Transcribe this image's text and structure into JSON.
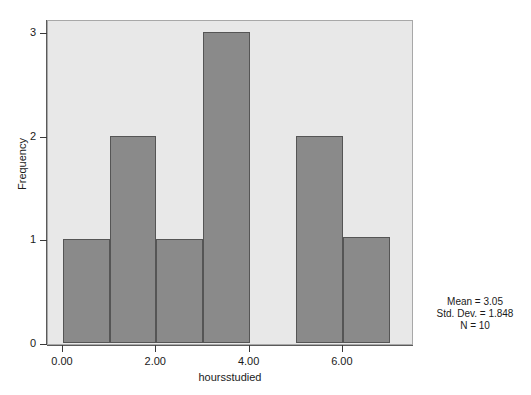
{
  "chart_data": {
    "type": "bar",
    "title": "",
    "subtitle": "",
    "xlabel": "hoursstudied",
    "ylabel": "Frequency",
    "xlim": [
      -0.33,
      7.53
    ],
    "ylim": [
      0,
      3.13
    ],
    "grid": false,
    "legend": null,
    "bin_width": 1,
    "bin_edges": [
      0,
      1,
      2,
      3,
      4,
      5,
      6,
      7
    ],
    "categories": [
      "0-1",
      "1-2",
      "2-3",
      "3-4",
      "4-5",
      "5-6",
      "6-7"
    ],
    "values": [
      1,
      2,
      1,
      3,
      0,
      2,
      1.02
    ],
    "bin_starts": [
      0,
      1,
      2,
      3,
      4,
      5,
      6
    ],
    "x_ticks": [
      0,
      2,
      4,
      6
    ],
    "x_tick_labels": [
      "0.00",
      "2.00",
      "4.00",
      "6.00"
    ],
    "y_ticks": [
      0,
      1,
      2,
      3
    ],
    "y_tick_labels": [
      "0",
      "1",
      "2",
      "3"
    ],
    "bar_color": "#8a8a8a",
    "bar_edge_color": "#555555",
    "panel_color": "#e8e8e8",
    "annotations": [
      "Mean = 3.05",
      "Std. Dev. = 1.848",
      "N = 10"
    ]
  },
  "stats": {
    "mean_label": "Mean = 3.05",
    "stddev_label": "Std. Dev. = 1.848",
    "n_label": "N = 10"
  }
}
